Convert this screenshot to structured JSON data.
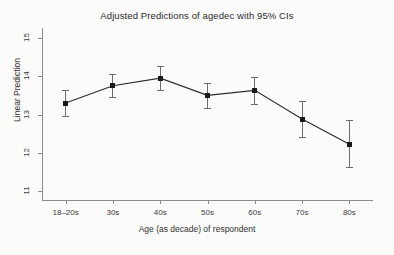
{
  "chart_data": {
    "type": "line",
    "title": "Adjusted Predictions of agedec with 95% CIs",
    "xlabel": "Age (as decade) of respondent",
    "ylabel": "Linear Prediction",
    "categories": [
      "18–20s",
      "30s",
      "40s",
      "50s",
      "60s",
      "70s",
      "80s"
    ],
    "values": [
      13.3,
      13.75,
      13.95,
      13.5,
      13.63,
      12.88,
      12.22
    ],
    "ci_lower": [
      12.97,
      13.45,
      13.63,
      13.18,
      13.28,
      12.4,
      11.62
    ],
    "ci_upper": [
      13.65,
      14.07,
      14.27,
      13.81,
      13.98,
      13.36,
      12.85
    ],
    "yticks": [
      11,
      12,
      13,
      14,
      15
    ],
    "ytick_labels": [
      "11",
      "12",
      "13",
      "14",
      "15"
    ],
    "ylim": [
      10.74,
      15.26
    ],
    "grid": false,
    "legend": "none",
    "series": [
      {
        "name": "Linear Prediction",
        "values": [
          13.3,
          13.75,
          13.95,
          13.5,
          13.63,
          12.88,
          12.22
        ]
      }
    ],
    "colors": {
      "line": "#2b2b2b",
      "marker": "#1a1a1a",
      "error_bar": "#6d6d6d",
      "axis": "#8c8c8c",
      "background": "#fbfbfa"
    }
  }
}
